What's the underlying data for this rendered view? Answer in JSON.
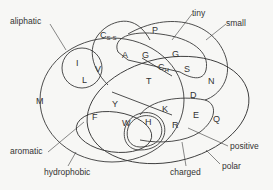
{
  "diagram": {
    "set_labels": {
      "aliphatic": "aliphatic",
      "tiny": "tiny",
      "small": "small",
      "aromatic": "aromatic",
      "hydrophobic": "hydrophobic",
      "charged": "charged",
      "positive": "positive",
      "polar": "polar"
    },
    "amino_acids": {
      "I": "I",
      "V": "V",
      "L": "L",
      "Css_base": "C",
      "Css_sub": "S-S",
      "A": "A",
      "G1": "G",
      "P": "P",
      "G2": "G",
      "Ch_base": "C",
      "Ch_sub": "H",
      "S": "S",
      "T": "T",
      "N": "N",
      "D": "D",
      "M": "M",
      "F": "F",
      "Y": "Y",
      "W": "W",
      "H": "H",
      "K": "K",
      "R": "R",
      "E": "E",
      "Q": "Q"
    },
    "colors": {
      "line": "#3a3a3a",
      "text": "#333333",
      "background": "#f7f7f5"
    }
  }
}
